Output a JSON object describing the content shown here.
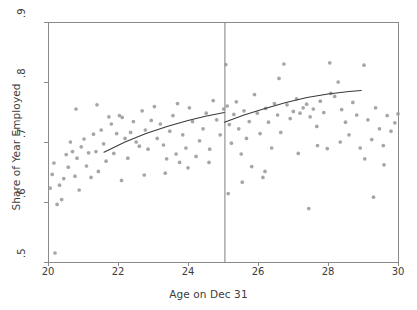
{
  "chart_data": {
    "type": "scatter",
    "title": "",
    "xlabel": "Age on Dec 31",
    "ylabel": "Share of Year Employed",
    "xlim": [
      20,
      30
    ],
    "ylim": [
      0.5,
      0.9
    ],
    "xticks": [
      20,
      22,
      24,
      26,
      28,
      30
    ],
    "xtick_labels": [
      "20",
      "22",
      "24",
      "26",
      "28",
      "30"
    ],
    "yticks": [
      0.5,
      0.6,
      0.7,
      0.8,
      0.9
    ],
    "ytick_labels": [
      ".5",
      ".6",
      ".7",
      ".8",
      ".9"
    ],
    "grid": false,
    "legend": null,
    "point_color": "#9a9a9a",
    "line_color": "#3a3a3a",
    "frame_color": "#8a8a8a",
    "cutoff": {
      "x": 25.04,
      "label": "",
      "color": "#8a8a8a"
    },
    "series": [
      {
        "name": "Binned means",
        "type": "scatter",
        "points": [
          [
            20.06,
            0.623
          ],
          [
            20.12,
            0.646
          ],
          [
            20.17,
            0.665
          ],
          [
            20.2,
            0.515
          ],
          [
            20.26,
            0.596
          ],
          [
            20.33,
            0.628
          ],
          [
            20.39,
            0.604
          ],
          [
            20.45,
            0.639
          ],
          [
            20.52,
            0.679
          ],
          [
            20.58,
            0.658
          ],
          [
            20.64,
            0.7
          ],
          [
            20.7,
            0.684
          ],
          [
            20.77,
            0.643
          ],
          [
            20.83,
            0.673
          ],
          [
            20.89,
            0.62
          ],
          [
            20.95,
            0.692
          ],
          [
            21.03,
            0.705
          ],
          [
            21.1,
            0.66
          ],
          [
            21.16,
            0.682
          ],
          [
            21.23,
            0.641
          ],
          [
            21.3,
            0.713
          ],
          [
            21.37,
            0.684
          ],
          [
            21.44,
            0.651
          ],
          [
            21.52,
            0.72
          ],
          [
            21.59,
            0.697
          ],
          [
            21.66,
            0.668
          ],
          [
            21.74,
            0.742
          ],
          [
            21.81,
            0.73
          ],
          [
            21.88,
            0.681
          ],
          [
            21.96,
            0.714
          ],
          [
            22.04,
            0.744
          ],
          [
            22.12,
            0.741
          ],
          [
            22.2,
            0.706
          ],
          [
            22.28,
            0.673
          ],
          [
            22.36,
            0.716
          ],
          [
            22.44,
            0.734
          ],
          [
            22.52,
            0.7
          ],
          [
            22.61,
            0.693
          ],
          [
            22.69,
            0.752
          ],
          [
            22.78,
            0.72
          ],
          [
            22.86,
            0.688
          ],
          [
            22.95,
            0.736
          ],
          [
            23.04,
            0.759
          ],
          [
            23.12,
            0.706
          ],
          [
            23.21,
            0.73
          ],
          [
            23.3,
            0.695
          ],
          [
            23.39,
            0.672
          ],
          [
            23.48,
            0.718
          ],
          [
            23.57,
            0.744
          ],
          [
            23.66,
            0.68
          ],
          [
            23.76,
            0.666
          ],
          [
            23.85,
            0.712
          ],
          [
            23.94,
            0.69
          ],
          [
            24.04,
            0.757
          ],
          [
            24.13,
            0.734
          ],
          [
            24.23,
            0.676
          ],
          [
            24.33,
            0.702
          ],
          [
            24.43,
            0.722
          ],
          [
            24.52,
            0.748
          ],
          [
            24.62,
            0.688
          ],
          [
            24.72,
            0.769
          ],
          [
            24.82,
            0.737
          ],
          [
            24.92,
            0.712
          ],
          [
            25.02,
            0.755
          ],
          [
            25.08,
            0.829
          ],
          [
            25.12,
            0.76
          ],
          [
            25.18,
            0.729
          ],
          [
            25.24,
            0.698
          ],
          [
            25.31,
            0.746
          ],
          [
            25.38,
            0.767
          ],
          [
            25.45,
            0.722
          ],
          [
            25.52,
            0.68
          ],
          [
            25.6,
            0.752
          ],
          [
            25.67,
            0.706
          ],
          [
            25.75,
            0.734
          ],
          [
            25.82,
            0.659
          ],
          [
            25.9,
            0.779
          ],
          [
            25.98,
            0.748
          ],
          [
            26.06,
            0.714
          ],
          [
            26.14,
            0.641
          ],
          [
            26.22,
            0.756
          ],
          [
            26.3,
            0.733
          ],
          [
            26.39,
            0.69
          ],
          [
            26.47,
            0.764
          ],
          [
            26.56,
            0.745
          ],
          [
            26.65,
            0.716
          ],
          [
            26.74,
            0.83
          ],
          [
            26.83,
            0.762
          ],
          [
            26.92,
            0.739
          ],
          [
            27.01,
            0.751
          ],
          [
            27.1,
            0.772
          ],
          [
            27.2,
            0.748
          ],
          [
            27.29,
            0.757
          ],
          [
            27.39,
            0.763
          ],
          [
            27.49,
            0.742
          ],
          [
            27.58,
            0.755
          ],
          [
            27.68,
            0.726
          ],
          [
            27.78,
            0.768
          ],
          [
            27.88,
            0.749
          ],
          [
            27.98,
            0.689
          ],
          [
            28.08,
            0.781
          ],
          [
            28.19,
            0.776
          ],
          [
            28.29,
            0.8
          ],
          [
            28.39,
            0.754
          ],
          [
            28.5,
            0.733
          ],
          [
            28.6,
            0.712
          ],
          [
            28.71,
            0.766
          ],
          [
            28.82,
            0.745
          ],
          [
            28.92,
            0.69
          ],
          [
            29.03,
            0.828
          ],
          [
            29.14,
            0.737
          ],
          [
            29.25,
            0.704
          ],
          [
            29.36,
            0.757
          ],
          [
            29.47,
            0.722
          ],
          [
            29.58,
            0.694
          ],
          [
            29.69,
            0.744
          ],
          [
            29.8,
            0.718
          ],
          [
            29.91,
            0.732
          ],
          [
            30.0,
            0.747
          ],
          [
            22.1,
            0.636
          ],
          [
            22.75,
            0.645
          ],
          [
            23.35,
            0.648
          ],
          [
            24.0,
            0.657
          ],
          [
            24.6,
            0.666
          ],
          [
            25.55,
            0.633
          ],
          [
            26.2,
            0.651
          ],
          [
            27.15,
            0.681
          ],
          [
            27.7,
            0.694
          ],
          [
            28.35,
            0.7
          ],
          [
            29.05,
            0.672
          ],
          [
            29.6,
            0.662
          ],
          [
            20.8,
            0.755
          ],
          [
            21.4,
            0.762
          ],
          [
            26.6,
            0.806
          ],
          [
            23.7,
            0.764
          ],
          [
            28.05,
            0.832
          ],
          [
            29.3,
            0.608
          ],
          [
            27.45,
            0.589
          ],
          [
            25.15,
            0.614
          ]
        ]
      },
      {
        "name": "Fit left of cutoff",
        "type": "line",
        "points": [
          [
            21.6,
            0.683
          ],
          [
            22.2,
            0.7
          ],
          [
            22.8,
            0.714
          ],
          [
            23.4,
            0.726
          ],
          [
            24.0,
            0.736
          ],
          [
            24.5,
            0.743
          ],
          [
            25.04,
            0.749
          ]
        ]
      },
      {
        "name": "Fit right of cutoff",
        "type": "line",
        "points": [
          [
            25.04,
            0.733
          ],
          [
            25.6,
            0.745
          ],
          [
            26.2,
            0.756
          ],
          [
            26.8,
            0.766
          ],
          [
            27.4,
            0.774
          ],
          [
            28.0,
            0.78
          ],
          [
            28.6,
            0.784
          ],
          [
            28.95,
            0.786
          ]
        ]
      }
    ]
  }
}
